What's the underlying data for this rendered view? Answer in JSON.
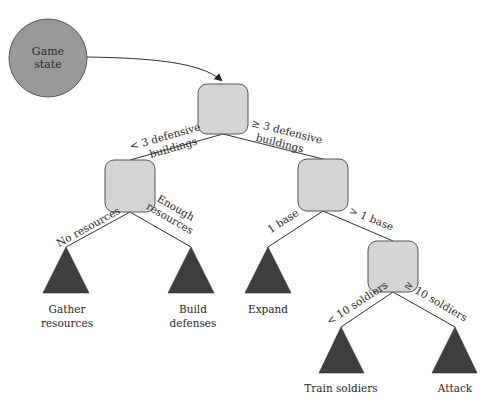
{
  "start_node": {
    "line1": "Game",
    "line2": "state"
  },
  "edges": {
    "root_left": {
      "line1": "< 3 defensive",
      "line2": "buildings"
    },
    "root_right": {
      "line1": "≥ 3 defensive",
      "line2": "buildings"
    },
    "left_left": "No resources",
    "left_right": {
      "line1": "Enough",
      "line2": "resources"
    },
    "right_left": "1 base",
    "right_right": "> 1 base",
    "bottom_left": "< 10 soldiers",
    "bottom_right": "≥ 10 soldiers"
  },
  "leaves": {
    "gather": {
      "line1": "Gather",
      "line2": "resources"
    },
    "build": {
      "line1": "Build",
      "line2": "defenses"
    },
    "expand": "Expand",
    "train": "Train soldiers",
    "attack": "Attack"
  },
  "colors": {
    "start_fill": "#999999",
    "node_fill": "#d4d4d4",
    "leaf_fill": "#3e3e3e"
  }
}
